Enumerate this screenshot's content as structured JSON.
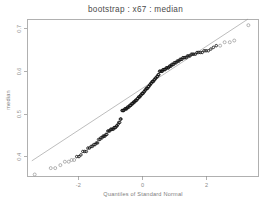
{
  "chart_data": {
    "type": "scatter",
    "title": "bootstrap : x67 : median",
    "xlabel": "Quantiles of Standard Normal",
    "ylabel": "median",
    "xlim": [
      -3.6,
      3.6
    ],
    "ylim": [
      0.355,
      0.723
    ],
    "grid": false,
    "legend": null,
    "xticks": [
      -2,
      0,
      2
    ],
    "xticklabels": [
      "-2",
      "0",
      "2"
    ],
    "yticks": [
      0.4,
      0.5,
      0.6,
      0.7
    ],
    "yticklabels": [
      "0.4",
      "0.5",
      "0.6",
      "0.7"
    ],
    "reference_line": {
      "description": "normal quantile-quantile reference line through the quartiles",
      "x": [
        -3.45,
        3.3
      ],
      "y": [
        0.3905,
        0.7235
      ]
    },
    "series": [
      {
        "name": "bootstrap median replicates",
        "marker": "open-circle",
        "x": [
          -3.36,
          -2.86,
          -2.72,
          -2.56,
          -2.42,
          -2.3,
          -2.21,
          -2.13,
          -2.05,
          -1.98,
          -1.92,
          -1.86,
          -1.8,
          -1.75,
          -1.7,
          -1.65,
          -1.6,
          -1.56,
          -1.52,
          -1.48,
          -1.44,
          -1.4,
          -1.37,
          -1.33,
          -1.3,
          -1.26,
          -1.23,
          -1.2,
          -1.17,
          -1.14,
          -1.11,
          -1.08,
          -1.05,
          -1.02,
          -0.99,
          -0.97,
          -0.94,
          -0.91,
          -0.89,
          -0.86,
          -0.84,
          -0.81,
          -0.79,
          -0.76,
          -0.74,
          -0.71,
          -0.69,
          -0.67,
          -0.64,
          -0.62,
          -0.6,
          -0.58,
          -0.55,
          -0.53,
          -0.51,
          -0.49,
          -0.47,
          -0.45,
          -0.42,
          -0.4,
          -0.38,
          -0.36,
          -0.34,
          -0.32,
          -0.3,
          -0.28,
          -0.26,
          -0.24,
          -0.22,
          -0.2,
          -0.18,
          -0.16,
          -0.14,
          -0.12,
          -0.1,
          -0.08,
          -0.06,
          -0.04,
          -0.02,
          0.0,
          0.02,
          0.04,
          0.06,
          0.08,
          0.1,
          0.12,
          0.14,
          0.16,
          0.18,
          0.2,
          0.22,
          0.24,
          0.26,
          0.28,
          0.3,
          0.32,
          0.34,
          0.36,
          0.38,
          0.4,
          0.42,
          0.45,
          0.47,
          0.49,
          0.51,
          0.53,
          0.55,
          0.58,
          0.6,
          0.62,
          0.64,
          0.67,
          0.69,
          0.71,
          0.74,
          0.76,
          0.79,
          0.81,
          0.84,
          0.86,
          0.89,
          0.91,
          0.94,
          0.97,
          0.99,
          1.02,
          1.05,
          1.08,
          1.11,
          1.14,
          1.17,
          1.2,
          1.23,
          1.26,
          1.3,
          1.33,
          1.37,
          1.4,
          1.44,
          1.48,
          1.52,
          1.56,
          1.6,
          1.65,
          1.7,
          1.75,
          1.8,
          1.86,
          1.92,
          1.98,
          2.05,
          2.13,
          2.21,
          2.3,
          2.42,
          2.56,
          2.72,
          2.86,
          3.3
        ],
        "y": [
          0.3585,
          0.3735,
          0.3735,
          0.3805,
          0.3885,
          0.3885,
          0.3925,
          0.3925,
          0.4005,
          0.4005,
          0.4045,
          0.4125,
          0.4125,
          0.4125,
          0.4205,
          0.4205,
          0.4245,
          0.4245,
          0.4285,
          0.4285,
          0.4325,
          0.4325,
          0.4405,
          0.4405,
          0.4445,
          0.4445,
          0.4485,
          0.4485,
          0.4485,
          0.4525,
          0.4525,
          0.4605,
          0.4605,
          0.4605,
          0.4645,
          0.4645,
          0.4645,
          0.4645,
          0.4685,
          0.4685,
          0.4685,
          0.4725,
          0.4725,
          0.4765,
          0.4805,
          0.4805,
          0.4885,
          0.4885,
          0.5085,
          0.5085,
          0.5085,
          0.5085,
          0.5125,
          0.5125,
          0.5125,
          0.5125,
          0.5165,
          0.5165,
          0.5165,
          0.5205,
          0.5205,
          0.5205,
          0.5245,
          0.5245,
          0.5245,
          0.5285,
          0.5285,
          0.5285,
          0.5325,
          0.5325,
          0.5325,
          0.5365,
          0.5365,
          0.5405,
          0.5405,
          0.5405,
          0.5445,
          0.5445,
          0.5485,
          0.5485,
          0.5485,
          0.5525,
          0.5525,
          0.5565,
          0.5565,
          0.5605,
          0.5605,
          0.5605,
          0.5645,
          0.5645,
          0.5685,
          0.5685,
          0.5725,
          0.5725,
          0.5765,
          0.5765,
          0.5765,
          0.5805,
          0.5805,
          0.5845,
          0.5845,
          0.5885,
          0.5885,
          0.5925,
          0.5925,
          0.6005,
          0.6005,
          0.6005,
          0.6005,
          0.6005,
          0.6045,
          0.6045,
          0.6045,
          0.6045,
          0.6085,
          0.6085,
          0.6085,
          0.6085,
          0.6125,
          0.6125,
          0.6125,
          0.6165,
          0.6165,
          0.6165,
          0.6205,
          0.6205,
          0.6205,
          0.6245,
          0.6245,
          0.6245,
          0.6285,
          0.6285,
          0.6285,
          0.6325,
          0.6325,
          0.6325,
          0.6325,
          0.6365,
          0.6365,
          0.6365,
          0.6405,
          0.6405,
          0.6405,
          0.6405,
          0.6445,
          0.6445,
          0.6445,
          0.6445,
          0.6485,
          0.6485,
          0.6485,
          0.6525,
          0.6565,
          0.6605,
          0.6605,
          0.6685,
          0.6685,
          0.6725,
          0.7085
        ]
      }
    ]
  },
  "figure": {
    "background_color": "#ffffff",
    "point_color": "#111111",
    "line_color": "#909090",
    "axis_color": "#8e8e8e"
  }
}
